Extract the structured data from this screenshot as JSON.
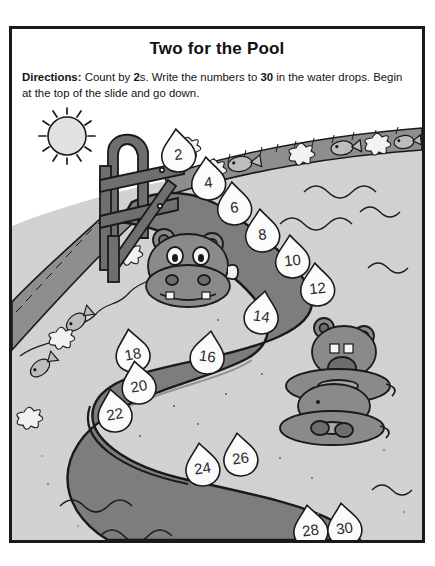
{
  "worksheet": {
    "title": "Two for the Pool",
    "directions": {
      "label": "Directions:",
      "part1": " Count by ",
      "bold1": "2",
      "part2": "s. Write the numbers to ",
      "bold2": "30",
      "part3": " in the water drops. Begin at the top of the slide and go down."
    }
  },
  "colors": {
    "ink": "#1a1a1a",
    "slide_dark": "#7d7d7d",
    "slide_shadow": "#6b6b6b",
    "pool_deck": "#d2d2d2",
    "water_light": "#cfcfcf",
    "edge_band": "#9a9a9a",
    "drop_fill": "#fbfbfb",
    "sun_fill": "#e2e2e2",
    "hippo_fill": "#8a8a8a",
    "page": "#ffffff"
  },
  "activity": {
    "skip_count_by": 2,
    "count_to": 30,
    "drops": [
      {
        "value": "2",
        "x": 166,
        "y": 44,
        "rot": -6
      },
      {
        "value": "4",
        "x": 196,
        "y": 72,
        "rot": -6
      },
      {
        "value": "6",
        "x": 222,
        "y": 97,
        "rot": -6
      },
      {
        "value": "8",
        "x": 250,
        "y": 124,
        "rot": -6
      },
      {
        "value": "10",
        "x": 280,
        "y": 150,
        "rot": -6
      },
      {
        "value": "12",
        "x": 305,
        "y": 178,
        "rot": -6
      },
      {
        "value": "14",
        "x": 250,
        "y": 206,
        "rot": 8
      },
      {
        "value": "16",
        "x": 196,
        "y": 246,
        "rot": 8
      },
      {
        "value": "18",
        "x": 120,
        "y": 244,
        "rot": -10
      },
      {
        "value": "20",
        "x": 126,
        "y": 276,
        "rot": -10
      },
      {
        "value": "22",
        "x": 102,
        "y": 304,
        "rot": -10
      },
      {
        "value": "24",
        "x": 190,
        "y": 358,
        "rot": -8
      },
      {
        "value": "26",
        "x": 228,
        "y": 348,
        "rot": -8
      },
      {
        "value": "28",
        "x": 298,
        "y": 420,
        "rot": -8
      },
      {
        "value": "30",
        "x": 332,
        "y": 418,
        "rot": -8
      }
    ]
  },
  "scene": {
    "sun": {
      "name": "sun",
      "x": 55,
      "y": 30,
      "radius": 19,
      "rays": 14
    },
    "hippos": [
      {
        "name": "hippo-on-slide",
        "x": 175,
        "y": 155
      },
      {
        "name": "hippo-on-tube",
        "x": 330,
        "y": 245
      }
    ],
    "decorations": {
      "fish_count": 5,
      "flower_count": 7,
      "wave_count": 6
    }
  }
}
